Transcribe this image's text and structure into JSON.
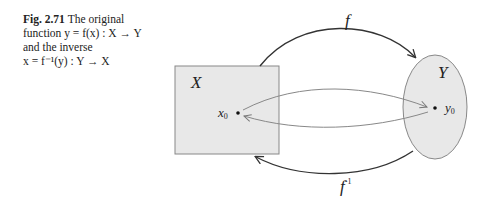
{
  "caption": {
    "label": "Fig. 2.71",
    "line1": "The original",
    "line2": "function y = f(x) : X → Y",
    "line3": "and the inverse",
    "line4": "x = f⁻¹(y) : Y → X"
  },
  "diagram": {
    "set_x_label": "X",
    "set_y_label": "Y",
    "point_x": "x",
    "point_x_sub": "0",
    "point_y": "y",
    "point_y_sub": "0",
    "forward_map": "f",
    "inverse_map": "f",
    "inverse_sup": "-1"
  }
}
